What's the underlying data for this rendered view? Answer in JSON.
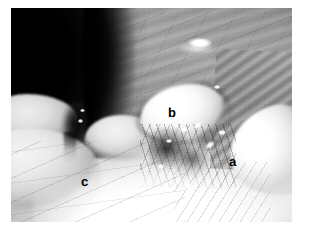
{
  "figure": {
    "kind": "photograph",
    "modality": "laparoscopic-endoscopic-still",
    "color_mode": "grayscale",
    "caption": "",
    "frame": {
      "left_px": 11,
      "top_px": 8,
      "width_px": 281,
      "height_px": 214,
      "page_background_hex": "#ffffff"
    }
  },
  "annotations": {
    "items": [
      {
        "id": "annot-a",
        "label": "a",
        "x_px": 236,
        "y_px": 162,
        "color_hex": "#000000",
        "region": "bright lobe at right of field"
      },
      {
        "id": "annot-b",
        "label": "b",
        "x_px": 175,
        "y_px": 113,
        "color_hex": "#000000",
        "region": "bright rounded mass at centre of field"
      },
      {
        "id": "annot-c",
        "label": "c",
        "x_px": 88,
        "y_px": 182,
        "color_hex": "#000000",
        "region": "tissue lobe at lower left of field"
      }
    ]
  },
  "scene": {
    "regions": [
      {
        "name": "dark-cavity",
        "description": "black shadowed recess",
        "position": "upper left",
        "tone_hex": "#050505"
      },
      {
        "name": "upper-sheet",
        "description": "striated serosal sheet with fine vessels",
        "position": "upper centre and upper right",
        "tone_hex": "#9b9b9b"
      },
      {
        "name": "specular-highlight",
        "description": "bright light reflection",
        "position": "upper right",
        "tone_hex": "#ffffff"
      },
      {
        "name": "mass-b",
        "description": "bright rounded mass",
        "position": "centre",
        "tone_hex": "#f7f7f7"
      },
      {
        "name": "right-tissue",
        "description": "striated fibrous band",
        "position": "right",
        "tone_hex": "#a0a0a0"
      },
      {
        "name": "lobe-right",
        "description": "bright tissue lobe",
        "position": "right lower",
        "tone_hex": "#fafafa"
      },
      {
        "name": "lobe-left-upper",
        "description": "rounded tissue lobe",
        "position": "left",
        "tone_hex": "#dcdcdc"
      },
      {
        "name": "lobe-left-lower",
        "description": "rounded tissue lobe",
        "position": "lower left",
        "tone_hex": "#e6e6e6"
      },
      {
        "name": "crevice",
        "description": "dark crevice between lobes",
        "position": "left of centre",
        "tone_hex": "#0a0a0a"
      },
      {
        "name": "hilum",
        "description": "cluster of dark vessels and ducts with metallic glints",
        "position": "centre lower",
        "tone_hex": "#3a3a3a"
      },
      {
        "name": "bottom-glow",
        "description": "over-exposed bright tissue",
        "position": "bottom",
        "tone_hex": "#ffffff"
      }
    ]
  }
}
